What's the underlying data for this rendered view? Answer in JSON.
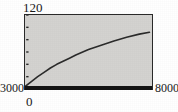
{
  "chart_data": {
    "type": "line",
    "title": "",
    "subtitle": "",
    "xlabel": "",
    "ylabel": "",
    "ymax_label": "120",
    "ymin_label": "0",
    "xmin_label": "3000",
    "xmax_label": "8000",
    "origin_label": "0",
    "xlim": [
      3000,
      8000
    ],
    "ylim": [
      0,
      120
    ],
    "grid": false,
    "legend": null,
    "legend_position": "none",
    "y_tick_count": 6,
    "y_ticks": [
      20,
      40,
      60,
      80,
      100,
      120
    ],
    "series": [
      {
        "name": "curve",
        "color": "#2b2b2b",
        "x": [
          3000,
          3250,
          3500,
          3750,
          4000,
          4250,
          4500,
          4750,
          5000,
          5500,
          6000,
          6500,
          7000,
          7500,
          7900
        ],
        "values": [
          4,
          12,
          20,
          27,
          34,
          40,
          45,
          50,
          55,
          64,
          71,
          78,
          84,
          89,
          92
        ]
      },
      {
        "name": "baseline",
        "color": "#141414",
        "x": [
          3000,
          8000
        ],
        "values": [
          0,
          0
        ]
      }
    ],
    "annotations": []
  },
  "colors": {
    "plot_background": "#d4d3d0",
    "page_background": "#ffffff",
    "frame": "#2a2a2a",
    "curve": "#2b2b2b",
    "baseline": "#141414",
    "text": "#1a1a1a"
  }
}
